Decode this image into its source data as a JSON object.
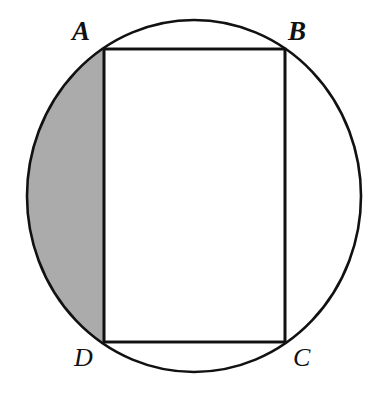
{
  "figure": {
    "kind": "geometry-diagram",
    "canvas": {
      "width": 377,
      "height": 393,
      "background": "#ffffff"
    },
    "colors": {
      "stroke": "#111111",
      "shaded_segment_fill": "#ababab",
      "rectangle_fill": "#ffffff",
      "circle_fill": "#ffffff",
      "label_color": "#111111"
    },
    "stroke_width": 2.6,
    "circle": {
      "name": "circumscribed-circle",
      "center_x": 194,
      "center_y": 196,
      "radius_x": 167,
      "radius_y": 176
    },
    "rectangle": {
      "name": "inscribed-rectangle-ABCD",
      "left": 104,
      "top": 49,
      "right": 285,
      "bottom": 342,
      "width": 181,
      "height": 293
    },
    "shaded_region": {
      "name": "shaded-circular-segment-left-of-AD",
      "chord": "AD",
      "chord_x": 104,
      "fill": "#ababab"
    },
    "labels": [
      {
        "id": "A",
        "text": "A",
        "x": 72,
        "y": 18,
        "weight": "heavy",
        "size": 27,
        "vertex_x": 104,
        "vertex_y": 49
      },
      {
        "id": "B",
        "text": "B",
        "x": 288,
        "y": 18,
        "weight": "heavy",
        "size": 27,
        "vertex_x": 285,
        "vertex_y": 49
      },
      {
        "id": "C",
        "text": "C",
        "x": 293,
        "y": 345,
        "weight": "light",
        "size": 26,
        "vertex_x": 285,
        "vertex_y": 342
      },
      {
        "id": "D",
        "text": "D",
        "x": 74,
        "y": 345,
        "weight": "light",
        "size": 26,
        "vertex_x": 104,
        "vertex_y": 342
      }
    ],
    "edges": [
      {
        "id": "AB",
        "from": "A",
        "to": "B"
      },
      {
        "id": "BC",
        "from": "B",
        "to": "C"
      },
      {
        "id": "CD",
        "from": "C",
        "to": "D"
      },
      {
        "id": "DA",
        "from": "D",
        "to": "A"
      }
    ]
  }
}
